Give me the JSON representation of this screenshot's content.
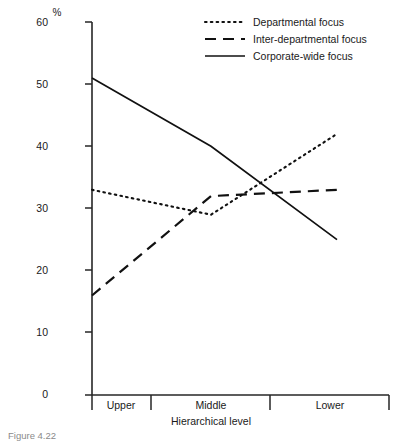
{
  "chart_data": {
    "type": "line",
    "title": "",
    "xlabel": "Hierarchical level",
    "ylabel": "%",
    "categories": [
      "Upper",
      "Middle",
      "Lower"
    ],
    "ylim": [
      0,
      60
    ],
    "yticks": [
      0,
      10,
      20,
      30,
      40,
      50,
      60
    ],
    "grid": false,
    "legend_position": "top-right",
    "series": [
      {
        "name": "Departmental focus",
        "style": "dotted",
        "values": [
          33,
          29,
          42
        ]
      },
      {
        "name": "Inter-departmental focus",
        "style": "dashed",
        "values": [
          16,
          32,
          33
        ]
      },
      {
        "name": "Corporate-wide focus",
        "style": "solid",
        "values": [
          51,
          40,
          25
        ]
      }
    ]
  },
  "axes": {
    "y_unit_label": "%",
    "y_tick_labels": [
      "60",
      "50",
      "40",
      "30",
      "20",
      "10",
      "0"
    ],
    "x_axis_title": "Hierarchical level",
    "x_category_labels": [
      "Upper",
      "Middle",
      "Lower"
    ]
  },
  "legend": {
    "entries": [
      {
        "label": "Departmental focus"
      },
      {
        "label": "Inter-departmental focus"
      },
      {
        "label": "Corporate-wide focus"
      }
    ]
  },
  "caption": {
    "text": "Figure 4.22"
  },
  "colors": {
    "ink": "#111111",
    "axis": "#262626",
    "background": "#ffffff"
  }
}
